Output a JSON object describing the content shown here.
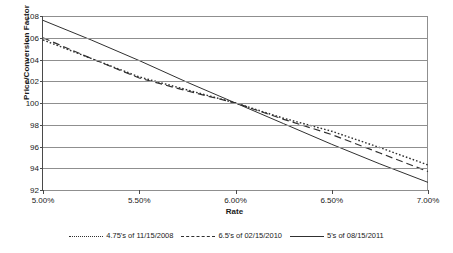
{
  "chart_data": {
    "type": "line",
    "title": "",
    "xlabel": "Rate",
    "ylabel": "Price/Conversion Factor",
    "xlim": [
      5.0,
      7.0
    ],
    "ylim": [
      92,
      108
    ],
    "grid": true,
    "legend_position": "bottom",
    "x_tick_labels": [
      "5.00%",
      "5.50%",
      "6.00%",
      "6.50%",
      "7.00%"
    ],
    "x_tick_values": [
      5.0,
      5.5,
      6.0,
      6.5,
      7.0
    ],
    "y_tick_labels": [
      "92",
      "94",
      "96",
      "98",
      "100",
      "102",
      "104",
      "106",
      "108"
    ],
    "y_tick_values": [
      92,
      94,
      96,
      98,
      100,
      102,
      104,
      106,
      108
    ],
    "x": [
      5.0,
      5.25,
      5.5,
      5.75,
      6.0,
      6.25,
      6.5,
      6.75,
      7.0
    ],
    "series": [
      {
        "name": "4.75's of 11/15/2008",
        "style": "dotted",
        "color": "#303030",
        "values": [
          105.8,
          104.1,
          102.4,
          101.2,
          100.0,
          98.6,
          97.4,
          95.9,
          94.3
        ]
      },
      {
        "name": "6.5's of 02/15/2010",
        "style": "dashed",
        "color": "#303030",
        "values": [
          106.0,
          104.1,
          102.3,
          101.1,
          100.0,
          98.5,
          97.1,
          95.4,
          93.7
        ]
      },
      {
        "name": "5's of 08/15/2011",
        "style": "solid",
        "color": "#303030",
        "values": [
          107.6,
          105.8,
          103.9,
          101.9,
          100.0,
          98.1,
          96.2,
          94.4,
          92.7
        ]
      }
    ]
  }
}
